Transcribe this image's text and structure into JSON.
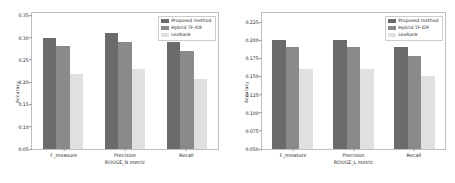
{
  "figure": {
    "background": "#ffffff",
    "panels": [
      "rouge_n",
      "rouge_l"
    ]
  },
  "colors": {
    "proposed": "#6b6b6b",
    "hybrid": "#8a8a8a",
    "lexrank": "#e0e0e0",
    "axis": "#bfbfbf",
    "text": "#262626"
  },
  "legend": {
    "proposed_label": "Proposed method",
    "hybrid_label": "Hybrid TF-IDF",
    "lexrank_label": "LexRank"
  },
  "left": {
    "ylabel": "Accuracy",
    "xlabel": "ROUGE_N metric",
    "yticks": [
      "0.35",
      "0.30",
      "0.25",
      "0.20",
      "0.15",
      "0.10",
      "0.05"
    ],
    "xticks": [
      "F_measure",
      "Precision",
      "Recall"
    ]
  },
  "right": {
    "ylabel": "Accuracy",
    "xlabel": "ROUGE_L metric",
    "yticks": [
      "0.225",
      "0.200",
      "0.175",
      "0.150",
      "0.125",
      "0.100",
      "0.075",
      "0.050"
    ],
    "xticks": [
      "F_measure",
      "Precision",
      "Recall"
    ]
  },
  "chart_data": [
    {
      "type": "bar",
      "title": "",
      "xlabel": "ROUGE_N metric",
      "ylabel": "Accuracy",
      "categories": [
        "F_measure",
        "Precision",
        "Recall"
      ],
      "ylim": [
        0.05,
        0.355
      ],
      "yticks": [
        0.05,
        0.1,
        0.15,
        0.2,
        0.25,
        0.3,
        0.35
      ],
      "grid": false,
      "legend_position": "upper right",
      "series": [
        {
          "name": "Proposed method",
          "color": "#6b6b6b",
          "values": [
            0.3,
            0.31,
            0.29
          ]
        },
        {
          "name": "Hybrid TF-IDF",
          "color": "#8a8a8a",
          "values": [
            0.28,
            0.29,
            0.27
          ]
        },
        {
          "name": "LexRank",
          "color": "#e0e0e0",
          "values": [
            0.219,
            0.229,
            0.208
          ]
        }
      ]
    },
    {
      "type": "bar",
      "title": "",
      "xlabel": "ROUGE_L metric",
      "ylabel": "Accuracy",
      "categories": [
        "F_measure",
        "Precision",
        "Recall"
      ],
      "ylim": [
        0.05,
        0.2375
      ],
      "yticks": [
        0.05,
        0.075,
        0.1,
        0.125,
        0.15,
        0.175,
        0.2,
        0.225
      ],
      "grid": false,
      "legend_position": "upper right",
      "series": [
        {
          "name": "Proposed method",
          "color": "#6b6b6b",
          "values": [
            0.2,
            0.2,
            0.19
          ]
        },
        {
          "name": "Hybrid TF-IDF",
          "color": "#8a8a8a",
          "values": [
            0.19,
            0.19,
            0.178
          ]
        },
        {
          "name": "LexRank",
          "color": "#e0e0e0",
          "values": [
            0.16,
            0.16,
            0.15
          ]
        }
      ]
    }
  ]
}
